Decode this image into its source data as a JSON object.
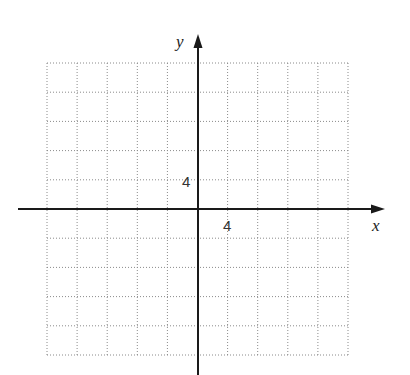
{
  "chart_data": {
    "type": "scatter",
    "title": "",
    "xlabel": "x",
    "ylabel": "y",
    "xlim": [
      -20,
      20
    ],
    "ylim": [
      -20,
      20
    ],
    "grid": true,
    "grid_style": "dotted",
    "grid_step": 4,
    "tick_labels": {
      "x": [
        "4"
      ],
      "y": [
        "4"
      ]
    },
    "series": []
  },
  "axes": {
    "x_label": "x",
    "y_label": "y",
    "x_tick_label": "4",
    "y_tick_label": "4"
  },
  "colors": {
    "axis": "#1a1a1a",
    "grid": "#8a8a8a",
    "background": "#ffffff"
  }
}
